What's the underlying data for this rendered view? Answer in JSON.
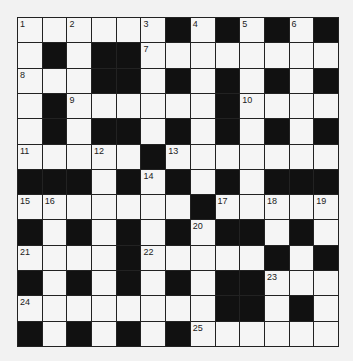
{
  "puzzle": {
    "rows": 13,
    "cols": 13,
    "colors": {
      "background": "#f2f2f2",
      "cell": "#f5f5f5",
      "block": "#111111",
      "line": "#222222"
    },
    "grid": [
      "...... . . . ",
      ". .  ........",
      "...  . . . . ",
      ". ...... ....",
      ". .  . . . . ",
      "..... .......",
      "   . . . .   ",
      "....... .....",
      " . . . .  . .",
      ".... ..... . ",
      " . . . .  ...",
      "........  . .",
      " . . . ......"
    ],
    "numbers": [
      {
        "r": 0,
        "c": 0,
        "n": "1"
      },
      {
        "r": 0,
        "c": 2,
        "n": "2"
      },
      {
        "r": 0,
        "c": 5,
        "n": "3"
      },
      {
        "r": 0,
        "c": 7,
        "n": "4"
      },
      {
        "r": 0,
        "c": 9,
        "n": "5"
      },
      {
        "r": 0,
        "c": 11,
        "n": "6"
      },
      {
        "r": 1,
        "c": 5,
        "n": "7"
      },
      {
        "r": 2,
        "c": 0,
        "n": "8"
      },
      {
        "r": 3,
        "c": 2,
        "n": "9"
      },
      {
        "r": 3,
        "c": 9,
        "n": "10"
      },
      {
        "r": 5,
        "c": 0,
        "n": "11"
      },
      {
        "r": 5,
        "c": 3,
        "n": "12"
      },
      {
        "r": 5,
        "c": 6,
        "n": "13"
      },
      {
        "r": 6,
        "c": 5,
        "n": "14"
      },
      {
        "r": 7,
        "c": 0,
        "n": "15"
      },
      {
        "r": 7,
        "c": 1,
        "n": "16"
      },
      {
        "r": 7,
        "c": 8,
        "n": "17"
      },
      {
        "r": 7,
        "c": 10,
        "n": "18"
      },
      {
        "r": 7,
        "c": 12,
        "n": "19"
      },
      {
        "r": 8,
        "c": 7,
        "n": "20"
      },
      {
        "r": 9,
        "c": 0,
        "n": "21"
      },
      {
        "r": 9,
        "c": 5,
        "n": "22"
      },
      {
        "r": 10,
        "c": 10,
        "n": "23"
      },
      {
        "r": 11,
        "c": 0,
        "n": "24"
      },
      {
        "r": 12,
        "c": 7,
        "n": "25"
      }
    ]
  }
}
